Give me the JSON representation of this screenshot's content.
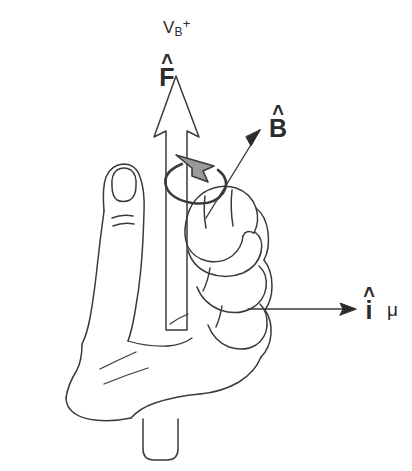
{
  "figure": {
    "stroke_color": "#3a3a3a",
    "arrow_fill": "#ffffff",
    "curl_arrow_fill": "#9a9a9a",
    "background": "#ffffff"
  },
  "labels": {
    "voltage": {
      "base": "V",
      "subscript": "B",
      "superscript": "+"
    },
    "force": {
      "hat": "˄",
      "symbol": "F"
    },
    "field": {
      "hat": "˄",
      "symbol": "B"
    },
    "current": {
      "hat": "˄",
      "symbol": "i"
    },
    "moment": {
      "symbol": "μ"
    }
  },
  "elements": {
    "force_arrow": "large-open-up-arrow",
    "curl_arrow": "counterclockwise-rotation-arrow",
    "field_arrow": "diagonal-arrow-up-right",
    "current_arrow": "horizontal-arrow-right",
    "hand": "fist-with-extended-thumb",
    "rod": "vertical-cylinder"
  }
}
